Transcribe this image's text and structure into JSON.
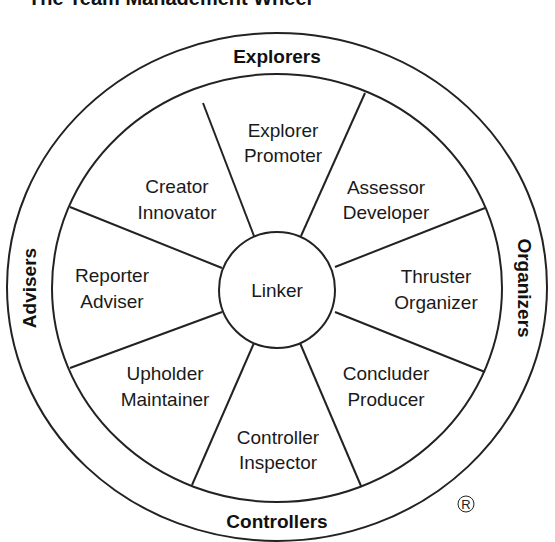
{
  "title": "The Team Management Wheel",
  "center": {
    "label": "Linker"
  },
  "outer_groups": {
    "top": "Explorers",
    "right": "Organizers",
    "bottom": "Controllers",
    "left": "Advisers"
  },
  "segments": [
    {
      "line1": "Explorer",
      "line2": "Promoter"
    },
    {
      "line1": "Assessor",
      "line2": "Developer"
    },
    {
      "line1": "Thruster",
      "line2": "Organizer"
    },
    {
      "line1": "Concluder",
      "line2": "Producer"
    },
    {
      "line1": "Controller",
      "line2": "Inspector"
    },
    {
      "line1": "Upholder",
      "line2": "Maintainer"
    },
    {
      "line1": "Reporter",
      "line2": "Adviser"
    },
    {
      "line1": "Creator",
      "line2": "Innovator"
    }
  ],
  "registered_mark": "®",
  "colors": {
    "line": "#222222",
    "text": "#1a1a1a",
    "background": "#ffffff"
  }
}
